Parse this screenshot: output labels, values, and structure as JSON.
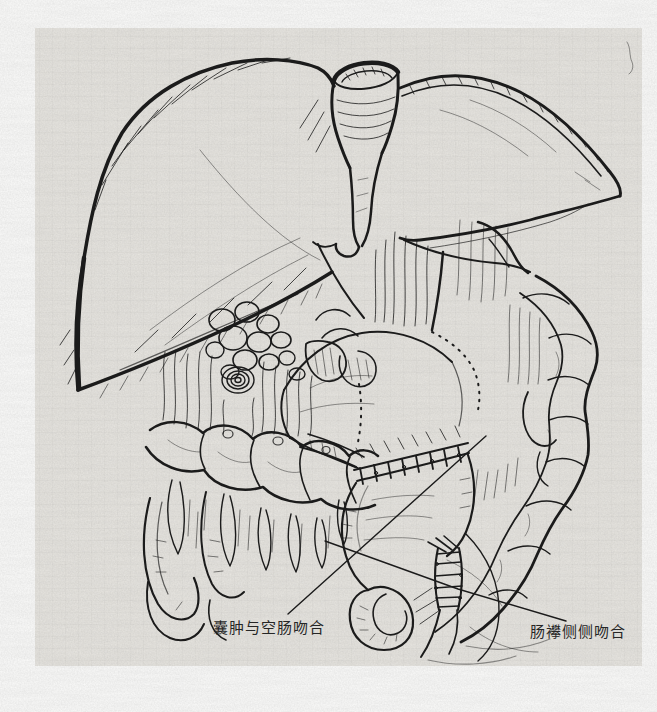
{
  "figure": {
    "kind": "scanned surgical line illustration",
    "labels": [
      {
        "id": "cyst-jejunum-anastomosis",
        "text": "囊肿与空肠吻合"
      },
      {
        "id": "bowel-loop-side-to-side-anastomosis",
        "text": "肠襻侧侧吻合"
      }
    ],
    "colors": {
      "ink": "#1b1b1b",
      "paper": "#e9e7e2",
      "page_margin": "#fdfdfc"
    }
  }
}
